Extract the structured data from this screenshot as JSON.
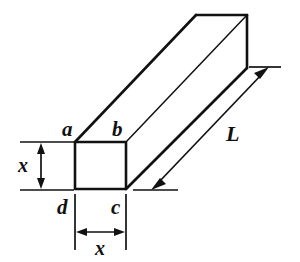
{
  "figure": {
    "type": "geometry-diagram",
    "background_color": "#ffffff",
    "line_color": "#111111",
    "labels": {
      "vertex_a": "a",
      "vertex_b": "b",
      "vertex_c": "c",
      "vertex_d": "d",
      "height_dim": "x",
      "width_dim": "x",
      "length_dim": "L"
    },
    "dimensions": {
      "cross_section_side": "x",
      "prism_length": "L"
    },
    "vertices": {
      "front_top_left": [
        75,
        142
      ],
      "front_top_right": [
        126,
        142
      ],
      "front_bottom_right": [
        126,
        189
      ],
      "front_bottom_left": [
        75,
        189
      ],
      "back_top_left": [
        196,
        15
      ],
      "back_top_right": [
        247,
        15
      ],
      "back_bottom_right": [
        247,
        68
      ]
    }
  }
}
